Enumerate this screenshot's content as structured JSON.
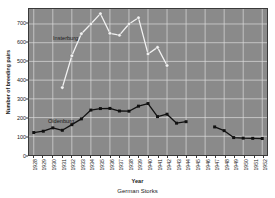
{
  "chart_data": {
    "type": "line",
    "title": "",
    "caption": "German Storks",
    "xlabel": "Year",
    "ylabel": "Number of breeding pairs",
    "ylim": [
      0,
      780
    ],
    "yticks": [
      0,
      100,
      200,
      300,
      400,
      500,
      600,
      700
    ],
    "grid": true,
    "legend_position": "inline-annotation",
    "x": [
      1928,
      1929,
      1930,
      1931,
      1932,
      1933,
      1934,
      1935,
      1936,
      1937,
      1938,
      1939,
      1940,
      1941,
      1942,
      1943,
      1944,
      1945,
      1946,
      1947,
      1948,
      1949,
      1950,
      1951,
      1952
    ],
    "xticklabels": [
      "1928",
      "1929",
      "1930",
      "1931",
      "1932",
      "1933",
      "1934",
      "1935",
      "1936",
      "1937",
      "1938",
      "1939",
      "1940",
      "1941",
      "1942",
      "1943",
      "1944",
      "1945",
      "1946",
      "1947",
      "1948",
      "1949",
      "1950",
      "1951",
      "1952"
    ],
    "series": [
      {
        "name": "Insterburg",
        "color": "#f2f2f2",
        "marker": "circle",
        "values": [
          null,
          null,
          null,
          360,
          530,
          648,
          700,
          755,
          650,
          640,
          700,
          733,
          540,
          575,
          478,
          null,
          null,
          null,
          null,
          null,
          null,
          null,
          null,
          null,
          null
        ]
      },
      {
        "name": "Oldenburg",
        "color": "#111111",
        "marker": "square",
        "values": [
          120,
          127,
          145,
          132,
          162,
          193,
          240,
          248,
          249,
          235,
          234,
          261,
          275,
          205,
          218,
          170,
          178,
          null,
          null,
          150,
          130,
          93,
          90,
          89,
          88
        ]
      }
    ],
    "annotations": [
      {
        "text": "Insterburg",
        "x": 1930,
        "y": 690
      },
      {
        "text": "Oldenburg",
        "x": 1929,
        "y": 300
      }
    ]
  },
  "figure": {
    "background_color": "#ffffff",
    "plot_background_color": "#8a8a8a",
    "grid_color": "#dcdcdc",
    "axis_color": "#3a3a3a"
  }
}
